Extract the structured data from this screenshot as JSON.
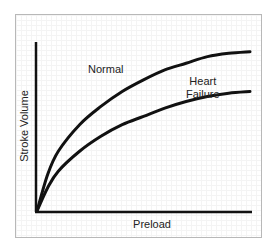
{
  "chart_data": {
    "type": "line",
    "title": "",
    "xlabel": "Preload",
    "ylabel": "Stroke Volume",
    "grid": true,
    "legend": "inline annotations",
    "x": [
      0,
      5,
      10,
      20,
      30,
      40,
      50,
      60,
      70,
      80,
      90,
      100
    ],
    "series": [
      {
        "name": "Normal",
        "values": [
          0,
          22,
          36,
          52,
          63,
          72,
          79,
          85,
          89,
          93,
          95,
          96
        ]
      },
      {
        "name": "Heart Failure",
        "values": [
          0,
          14,
          24,
          36,
          45,
          52,
          57,
          62,
          66,
          69,
          71,
          72
        ]
      }
    ],
    "annotations": [
      "Normal",
      "Heart Failure"
    ],
    "xlim": [
      0,
      100
    ],
    "ylim": [
      0,
      100
    ]
  },
  "labels": {
    "x_axis": "Preload",
    "y_axis": "Stroke Volume",
    "normal": "Normal",
    "heart_failure_line1": "Heart",
    "heart_failure_line2": "Failure"
  }
}
